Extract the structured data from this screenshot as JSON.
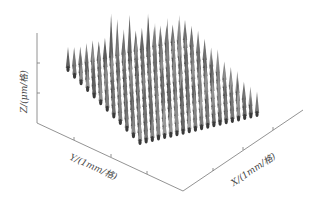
{
  "chart_data": {
    "type": "surface3d",
    "title": "",
    "xlabel": "X/(1mm/格)",
    "ylabel": "Y/(1mm/格)",
    "zlabel": "Z/(μm/格)",
    "grid": false,
    "legend": null,
    "colormap": "gray",
    "peak_grid": {
      "cols": 20,
      "rows": 12
    },
    "z_ticks": 3,
    "y_ticks": 3,
    "x_ticks": 3
  },
  "labels": {
    "x": "X/(1mm/格)",
    "y": "Y/(1mm/格)",
    "z": "Z/(μm/格)"
  }
}
